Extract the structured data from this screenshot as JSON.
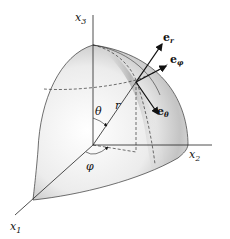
{
  "figure": {
    "axes": {
      "x1": {
        "label": "x",
        "sub": "1"
      },
      "x2": {
        "label": "x",
        "sub": "2"
      },
      "x3": {
        "label": "x",
        "sub": "3"
      }
    },
    "angles": {
      "theta": "θ",
      "phi": "φ"
    },
    "radius_label": "r",
    "unit_vectors": {
      "e_r": {
        "label": "e",
        "sub": "r"
      },
      "e_phi": {
        "label": "e",
        "sub": "φ"
      },
      "e_theta": {
        "label": "e",
        "sub": "θ"
      }
    },
    "colors": {
      "line": "#222222",
      "surface_light": "#f4f4f4",
      "surface_dark": "#9a9a9a"
    }
  }
}
